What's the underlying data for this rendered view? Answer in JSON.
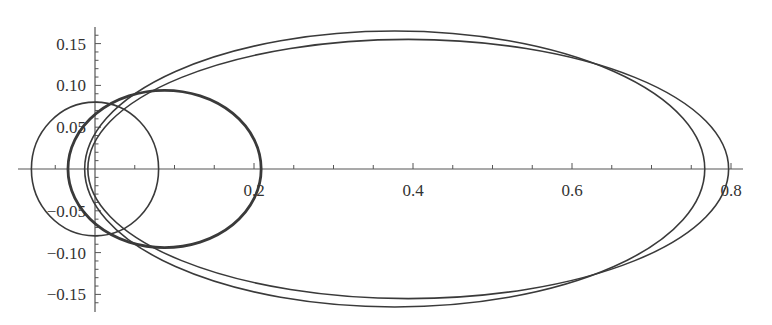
{
  "chart_data": {
    "type": "line",
    "title": "",
    "xlabel": "",
    "ylabel": "",
    "xlim": [
      -0.1,
      0.82
    ],
    "ylim": [
      -0.17,
      0.17
    ],
    "grid": false,
    "legend": null,
    "x_ticks": [
      {
        "value": 0.2,
        "label": "0.2"
      },
      {
        "value": 0.4,
        "label": "0.4"
      },
      {
        "value": 0.6,
        "label": "0.6"
      },
      {
        "value": 0.8,
        "label": "0.8"
      }
    ],
    "y_ticks": [
      {
        "value": 0.15,
        "label": "0.15"
      },
      {
        "value": 0.1,
        "label": "0.10"
      },
      {
        "value": 0.05,
        "label": "0.05"
      },
      {
        "value": -0.05,
        "label": "−0.05"
      },
      {
        "value": -0.1,
        "label": "−0.10"
      },
      {
        "value": -0.15,
        "label": "−0.15"
      }
    ],
    "series": [
      {
        "name": "circle",
        "shape": "ellipse",
        "cx": 0.0,
        "cy": 0.0,
        "rx": 0.08,
        "ry": 0.08,
        "stroke_width": 1.6
      },
      {
        "name": "small-orbit",
        "shape": "ellipse",
        "cx": 0.0875,
        "cy": 0.0,
        "rx": 0.1215,
        "ry": 0.094,
        "stroke_width": 2.8
      },
      {
        "name": "large-orbit-a",
        "shape": "ellipse",
        "cx": 0.377,
        "cy": 0.0,
        "rx": 0.39,
        "ry": 0.165,
        "stroke_width": 1.6
      },
      {
        "name": "large-orbit-b",
        "shape": "ellipse",
        "cx": 0.394,
        "cy": 0.0,
        "rx": 0.403,
        "ry": 0.155,
        "stroke_width": 1.6
      }
    ],
    "colors": {
      "line": "#3a3a3a",
      "axis": "#555555"
    }
  }
}
